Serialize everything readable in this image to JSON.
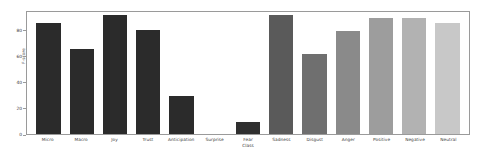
{
  "chart_data": {
    "type": "bar",
    "title": "",
    "xlabel": "",
    "ylabel": "F-score",
    "ylim": [
      0,
      95
    ],
    "yticks": [
      0,
      20,
      40,
      60,
      80
    ],
    "ytick_labels": [
      "0",
      "20",
      "40",
      "60",
      "80"
    ],
    "grid": false,
    "legend": "none",
    "categories": [
      "Micro",
      "Macro",
      "Joy",
      "Trust",
      "Anticipation",
      "Surprise",
      "Fear",
      "Sadness",
      "Disgust",
      "Anger",
      "Positive",
      "Negative",
      "Neutral"
    ],
    "category_lines": [
      [
        "Micro"
      ],
      [
        "Macro"
      ],
      [
        "Joy"
      ],
      [
        "Trust"
      ],
      [
        "Anticipation"
      ],
      [
        "Surprise"
      ],
      [
        "Fear",
        "Class"
      ],
      [
        "Sadness"
      ],
      [
        "Disgust"
      ],
      [
        "Anger"
      ],
      [
        "Positive"
      ],
      [
        "Negative"
      ],
      [
        "Neutral"
      ]
    ],
    "values": [
      85,
      65,
      91,
      80,
      29,
      0,
      9,
      91,
      61,
      79,
      89,
      89,
      85
    ],
    "bar_colors": [
      "#2b2b2b",
      "#2b2b2b",
      "#2b2b2b",
      "#2b2b2b",
      "#2b2b2b",
      "#2b2b2b",
      "#2f2f2f",
      "#5a5a5a",
      "#6f6f6f",
      "#8a8a8a",
      "#9d9d9d",
      "#b2b2b2",
      "#c8c8c8"
    ],
    "axis_color": "#9a9a9a",
    "text_color": "#3a3a3a",
    "background": "#ffffff"
  }
}
